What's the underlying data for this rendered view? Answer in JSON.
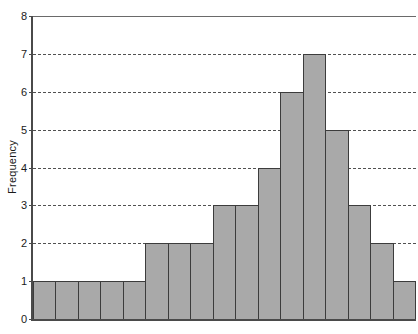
{
  "chart_data": {
    "type": "bar",
    "title": "",
    "subtitle": "",
    "xlabel": "",
    "ylabel": "Frequency",
    "ylim": [
      0,
      8
    ],
    "xlim": [
      0,
      17
    ],
    "grid": true,
    "legend": null,
    "y_ticks": [
      0,
      1,
      2,
      3,
      4,
      5,
      6,
      7,
      8
    ],
    "y_tick_labels": [
      "0",
      "1",
      "2",
      "3",
      "4",
      "5",
      "6",
      "7",
      "8"
    ],
    "x_ticks": [],
    "x_tick_labels": [],
    "categories": [
      "1",
      "2",
      "3",
      "4",
      "5",
      "6",
      "7",
      "8",
      "9",
      "10",
      "11",
      "12",
      "13",
      "14",
      "15",
      "16",
      "17"
    ],
    "values": [
      1,
      1,
      1,
      1,
      1,
      2,
      2,
      2,
      3,
      3,
      4,
      6,
      7,
      5,
      3,
      2,
      1
    ],
    "bar_fill_color": "#a9a9a9",
    "bar_edge_color": "#3c3c3c",
    "gridline_color": "#333333",
    "axis_color": "#4a4a4a",
    "background_color": "#ffffff",
    "total_count": 36
  },
  "axis": {
    "y_title": "Frequency"
  }
}
